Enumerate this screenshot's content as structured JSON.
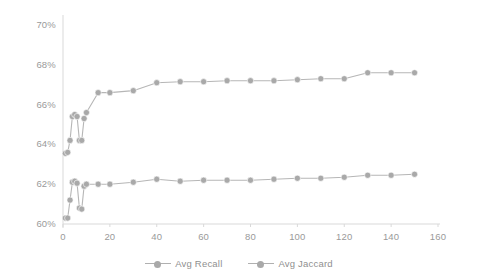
{
  "chart_data": {
    "type": "line",
    "title": "",
    "subtitle": "",
    "xlabel": "",
    "ylabel": "",
    "grid": false,
    "legend_position": "bottom",
    "xlim": [
      0,
      160
    ],
    "ylim": [
      60,
      70
    ],
    "xticks": [
      0,
      20,
      40,
      60,
      80,
      100,
      120,
      140,
      160
    ],
    "xtick_labels": [
      "0",
      "20",
      "40",
      "60",
      "80",
      "100",
      "120",
      "140",
      "160"
    ],
    "yticks": [
      60,
      62,
      64,
      66,
      68,
      70
    ],
    "ytick_labels": [
      "60%",
      "62%",
      "64%",
      "66%",
      "68%",
      "70%"
    ],
    "x": [
      1,
      2,
      3,
      4,
      5,
      6,
      7,
      8,
      9,
      10,
      15,
      20,
      30,
      40,
      50,
      60,
      70,
      80,
      90,
      100,
      110,
      120,
      130,
      140,
      150
    ],
    "series": [
      {
        "name": "Avg Recall",
        "color": "#a9a9a9",
        "values": [
          63.55,
          63.6,
          64.2,
          65.4,
          65.5,
          65.4,
          64.2,
          64.2,
          65.3,
          65.6,
          66.6,
          66.6,
          66.7,
          67.1,
          67.15,
          67.15,
          67.2,
          67.2,
          67.2,
          67.25,
          67.3,
          67.3,
          67.6,
          67.6,
          67.6
        ]
      },
      {
        "name": "Avg Jaccard",
        "color": "#a9a9a9",
        "values": [
          60.3,
          60.3,
          61.2,
          62.1,
          62.15,
          62.05,
          60.8,
          60.75,
          61.9,
          62.0,
          62.0,
          62.0,
          62.1,
          62.25,
          62.15,
          62.2,
          62.2,
          62.2,
          62.25,
          62.3,
          62.3,
          62.35,
          62.45,
          62.45,
          62.5
        ]
      }
    ]
  },
  "legend": {
    "items": [
      {
        "label": "Avg Recall"
      },
      {
        "label": "Avg Jaccard"
      }
    ]
  },
  "style": {
    "line_color": "#b6b6b6",
    "marker_color": "#a9a9a9",
    "axis_color": "#d9d9d9",
    "text_color": "#9a9a9a"
  }
}
